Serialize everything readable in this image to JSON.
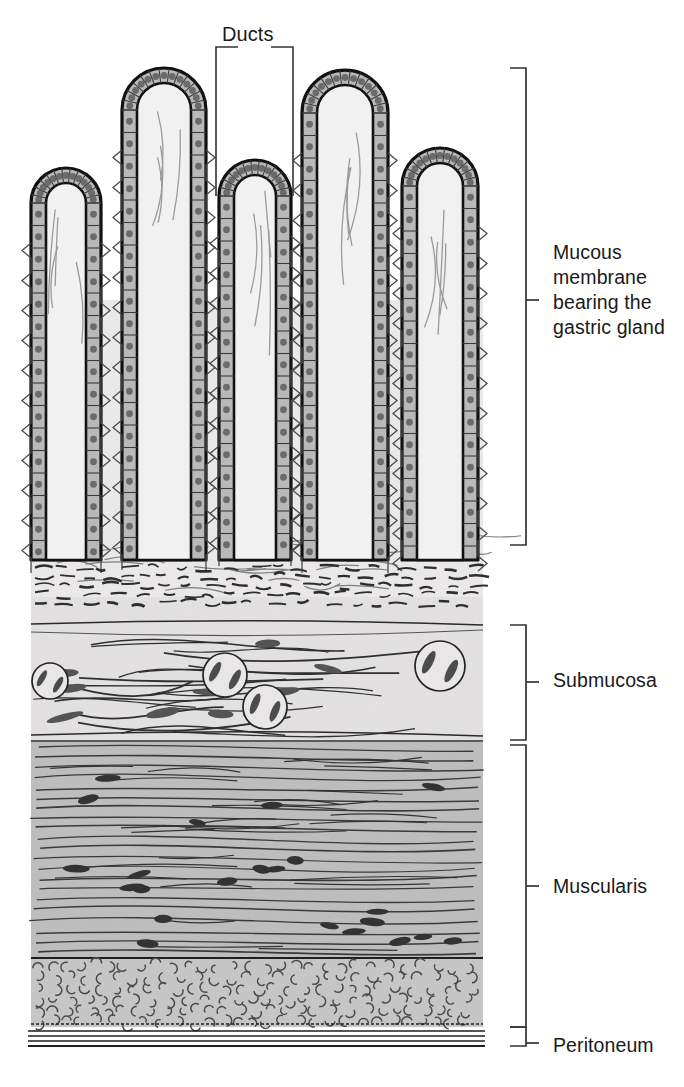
{
  "figure": {
    "type": "anatomical-cross-section",
    "labels": {
      "ducts": "Ducts",
      "mucous_membrane": "Mucous\nmembrane\nbearing the\ngastric gland",
      "submucosa": "Submucosa",
      "muscularis": "Muscularis",
      "peritoneum": "Peritoneum"
    },
    "layers": [
      {
        "name": "Mucous membrane bearing the gastric gland",
        "top": 68,
        "bottom": 545,
        "fill": "#eceaea"
      },
      {
        "name": "Submucosa",
        "top": 625,
        "bottom": 740,
        "fill": "#e2e0e0"
      },
      {
        "name": "Muscularis",
        "top": 745,
        "bottom": 1027,
        "fill": "#bcbcbc"
      },
      {
        "name": "Peritoneum",
        "top": 1029,
        "bottom": 1046,
        "fill": "#ffffff"
      }
    ],
    "colors": {
      "ink": "#1a1a1a",
      "outline": "#111111",
      "epithelium_fill": "#b9b9b9",
      "nucleus": "#6b6b6b",
      "lumen_fill": "#f2f1f1",
      "lamina_propria": "#ebe9e9",
      "submucosa_fill": "#e3e1e1",
      "muscularis_fill": "#bdbdbd",
      "circular_muscle_fill": "#c6c6c6",
      "fiber_line": "#3a3a3a",
      "bracket": "#333333"
    },
    "geometry": {
      "block_left": 31,
      "block_right": 483,
      "villi": [
        {
          "id": 1,
          "cx": 66,
          "tip_y": 168,
          "half_width": 35
        },
        {
          "id": 2,
          "cx": 164,
          "tip_y": 68,
          "half_width": 42
        },
        {
          "id": 3,
          "cx": 255,
          "tip_y": 160,
          "half_width": 36
        },
        {
          "id": 4,
          "cx": 345,
          "tip_y": 70,
          "half_width": 43
        },
        {
          "id": 5,
          "cx": 440,
          "tip_y": 148,
          "half_width": 38
        }
      ],
      "ducts_bracket": {
        "top_y": 47,
        "left_x": 216,
        "right_x": 293,
        "leg_bottom": 196
      },
      "brackets": [
        {
          "for": "mucous_membrane",
          "x": 526,
          "top": 68,
          "bottom": 545,
          "tick_y": 300
        },
        {
          "for": "submucosa",
          "x": 526,
          "top": 625,
          "bottom": 740,
          "tick_y": 682
        },
        {
          "for": "muscularis",
          "x": 526,
          "top": 745,
          "bottom": 1027,
          "tick_y": 886
        },
        {
          "for": "peritoneum",
          "x": 526,
          "top": 1027,
          "bottom": 1046,
          "tick_y": 1043
        }
      ],
      "submucosa_vessels": [
        {
          "cx": 50,
          "cy": 681,
          "r": 18
        },
        {
          "cx": 225,
          "cy": 675,
          "r": 22
        },
        {
          "cx": 265,
          "cy": 707,
          "r": 22
        },
        {
          "cx": 440,
          "cy": 666,
          "r": 25
        }
      ]
    }
  }
}
